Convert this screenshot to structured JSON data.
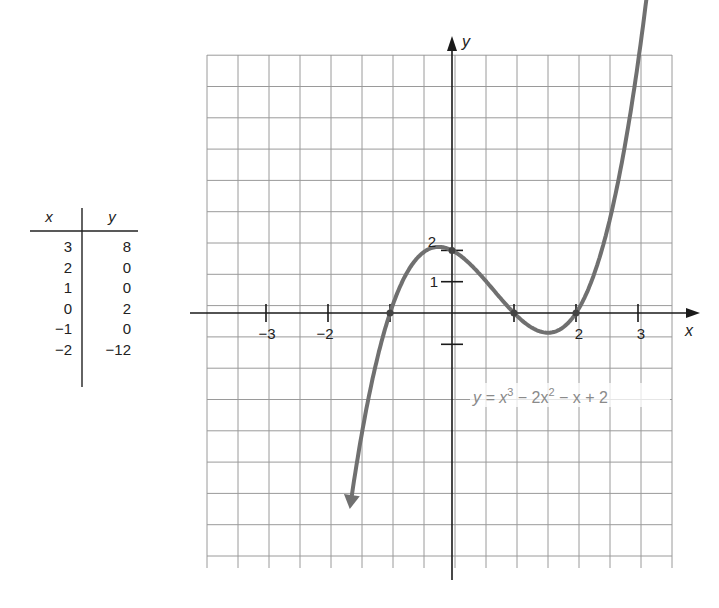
{
  "table": {
    "headers": {
      "x": "x",
      "y": "y"
    },
    "rows": [
      {
        "x": "3",
        "y": "8"
      },
      {
        "x": "2",
        "y": "0"
      },
      {
        "x": "1",
        "y": "0"
      },
      {
        "x": "0",
        "y": "2"
      },
      {
        "x": "−1",
        "y": "0"
      },
      {
        "x": "−2",
        "y": "−12"
      }
    ]
  },
  "graph": {
    "x_axis_label": "x",
    "y_axis_label": "y",
    "x_tick_labels": [
      {
        "value": -3,
        "label": "−3"
      },
      {
        "value": -2,
        "label": "−2"
      },
      {
        "value": 2,
        "label": "2"
      },
      {
        "value": 3,
        "label": "3"
      }
    ],
    "y_tick_labels": [
      {
        "value": 2,
        "label": "2"
      },
      {
        "value": 1,
        "label": "1"
      }
    ],
    "equation": {
      "prefix": "y = x",
      "exp1": "3",
      "mid": " − 2x",
      "exp2": "2",
      "suffix": " − x + 2"
    },
    "colors": {
      "curve": "#707070",
      "grid": "#9a9a9a",
      "axis": "#1a1a1a"
    }
  },
  "chart_data": {
    "type": "line",
    "title": "",
    "function": "y = x^3 - 2x^2 - x + 2",
    "xlabel": "x",
    "ylabel": "y",
    "x_ticks": [
      -3,
      -2,
      -1,
      1,
      2,
      3
    ],
    "x_tick_labels": [
      "-3",
      "-2",
      "2",
      "3"
    ],
    "y_ticks": [
      -1,
      1,
      2
    ],
    "y_tick_labels": [
      "1",
      "2"
    ],
    "xlim": [
      -3.9,
      3.6
    ],
    "ylim": [
      -8.4,
      8.2
    ],
    "grid": true,
    "marked_points": [
      {
        "x": -1,
        "y": 0
      },
      {
        "x": 0,
        "y": 2
      },
      {
        "x": 1,
        "y": 0
      },
      {
        "x": 2,
        "y": 0
      }
    ],
    "table": {
      "x": [
        3,
        2,
        1,
        0,
        -1,
        -2
      ],
      "y": [
        8,
        0,
        0,
        2,
        0,
        -12
      ]
    },
    "series": [
      {
        "name": "y = x^3 - 2x^2 - x + 2",
        "x": [
          -1.65,
          -1.5,
          -1.25,
          -1.0,
          -0.75,
          -0.5,
          -0.25,
          0.0,
          0.25,
          0.5,
          0.75,
          1.0,
          1.25,
          1.5,
          1.75,
          2.0,
          2.25,
          2.5,
          2.75,
          3.0,
          3.25
        ],
        "y": [
          -8.3,
          -6.1,
          -3.39,
          0.0,
          1.17,
          1.88,
          2.11,
          2.0,
          1.64,
          1.13,
          0.61,
          0.0,
          -0.42,
          -0.63,
          -0.61,
          0.0,
          1.14,
          2.63,
          4.64,
          8.0,
          10.6
        ]
      }
    ],
    "annotations": [
      "y = x^3 - 2x^2 - x + 2"
    ]
  }
}
